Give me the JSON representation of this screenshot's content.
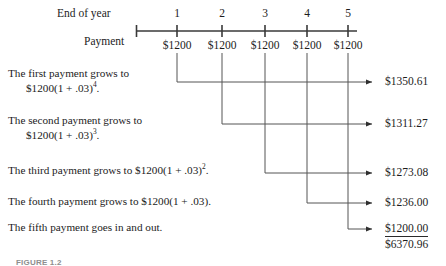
{
  "figure": {
    "caption": "FIGURE 1.2",
    "row_labels": {
      "end_of_year": "End of year",
      "payment": "Payment"
    },
    "timeline": {
      "years": [
        "1",
        "2",
        "3",
        "4",
        "5"
      ],
      "payments": [
        "$1200",
        "$1200",
        "$1200",
        "$1200",
        "$1200"
      ]
    },
    "statements": [
      {
        "line1": "The first payment grows to",
        "line2": "$1200(1 + .03)",
        "exp2": "4",
        "tail2": "."
      },
      {
        "line1": "The second payment grows to",
        "line2": "$1200(1 + .03)",
        "exp2": "3",
        "tail2": "."
      },
      {
        "line1": "The third payment grows to $1200(1 + .03)",
        "exp1": "2",
        "tail1": "."
      },
      {
        "line1": "The fourth payment grows to $1200(1 + .03)."
      },
      {
        "line1": "The fifth payment goes in and out."
      }
    ],
    "future_values": [
      "$1350.61",
      "$1311.27",
      "$1273.08",
      "$1236.00",
      "$1200.00"
    ],
    "total": "$6370.96",
    "colors": {
      "ink": "#1c1c1c",
      "axis": "#3a3a3a",
      "connector": "#555555"
    }
  }
}
